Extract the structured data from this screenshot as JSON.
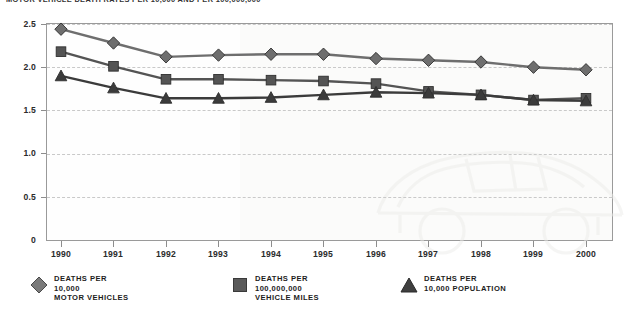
{
  "title": "MOTOR VEHICLE DEATH RATES PER 10,000 AND PER 100,000,000",
  "axes": {
    "y_ticks": [
      "0",
      "0.5",
      "1.0",
      "1.5",
      "2.0",
      "2.5"
    ],
    "x_ticks": [
      "1990",
      "1991",
      "1992",
      "1993",
      "1994",
      "1995",
      "1996",
      "1997",
      "1998",
      "1999",
      "2000"
    ],
    "ylim": [
      0,
      2.5
    ]
  },
  "legend": {
    "items": [
      {
        "marker": "diamond",
        "color": "#6e6e6e",
        "line1": "DEATHS PER",
        "line2": "10,000",
        "line3": "MOTOR VEHICLES"
      },
      {
        "marker": "square",
        "color": "#545454",
        "line1": "DEATHS PER",
        "line2": "100,000,000",
        "line3": "VEHICLE MILES"
      },
      {
        "marker": "triangle",
        "color": "#3b3b3b",
        "line1": "DEATHS PER",
        "line2": "10,000 POPULATION",
        "line3": ""
      }
    ]
  },
  "chart_data": {
    "type": "line",
    "title": "MOTOR VEHICLE DEATH RATES PER 10,000 AND PER 100,000,000",
    "xlabel": "",
    "ylabel": "",
    "ylim": [
      0,
      2.5
    ],
    "grid": true,
    "legend_position": "bottom",
    "categories": [
      "1990",
      "1991",
      "1992",
      "1993",
      "1994",
      "1995",
      "1996",
      "1997",
      "1998",
      "1999",
      "2000"
    ],
    "series": [
      {
        "name": "DEATHS PER 10,000 MOTOR VEHICLES",
        "marker": "diamond",
        "color": "#6e6e6e",
        "values": [
          2.44,
          2.28,
          2.12,
          2.14,
          2.15,
          2.15,
          2.1,
          2.08,
          2.06,
          2.0,
          1.97
        ]
      },
      {
        "name": "DEATHS PER 100,000,000 VEHICLE MILES",
        "marker": "square",
        "color": "#545454",
        "values": [
          2.18,
          2.01,
          1.86,
          1.86,
          1.85,
          1.84,
          1.81,
          1.72,
          1.68,
          1.62,
          1.64
        ]
      },
      {
        "name": "DEATHS PER 10,000 POPULATION",
        "marker": "triangle",
        "color": "#3b3b3b",
        "values": [
          1.9,
          1.76,
          1.64,
          1.64,
          1.65,
          1.68,
          1.71,
          1.7,
          1.68,
          1.62,
          1.61
        ]
      }
    ]
  }
}
